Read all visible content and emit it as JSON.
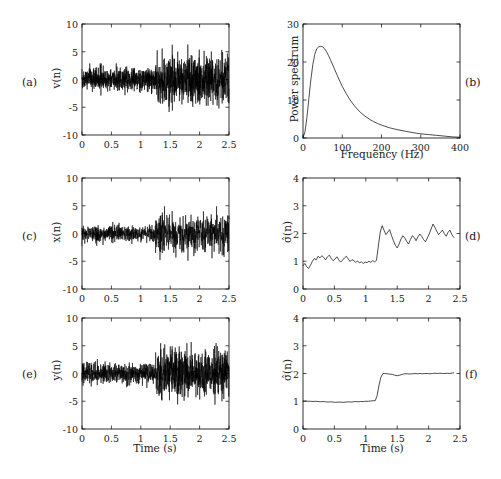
{
  "figure": {
    "width": 501,
    "height": 479,
    "background": "#ffffff",
    "line_color": "#000000"
  },
  "panel_labels": {
    "a": "(a)",
    "b": "(b)",
    "c": "(c)",
    "d": "(d)",
    "e": "(e)",
    "f": "(f)"
  },
  "chart_data": [
    {
      "id": "a",
      "type": "line",
      "title": "",
      "xlabel": "",
      "ylabel": "v(n)",
      "ylabel_glyph": "v(n)",
      "xlim": [
        0,
        2.5
      ],
      "ylim": [
        -10,
        10
      ],
      "xticks": [
        0,
        0.5,
        1,
        1.5,
        2,
        2.5
      ],
      "xticklabels": [
        "0",
        "0.5",
        "1",
        "1.5",
        "2",
        "2.5"
      ],
      "yticks": [
        -10,
        -5,
        0,
        5,
        10
      ],
      "yticklabels": [
        "-10",
        "-5",
        "0",
        "5",
        "10"
      ],
      "grid": false,
      "legend": "none",
      "description": "Noise signal v(n) with variance step change at t=1.25 s; amplitude envelope ~±2.8 before, ~±6.5 after",
      "signal": {
        "kind": "noise_burst",
        "seed": 11,
        "samples": 1400,
        "segments": [
          {
            "t_start": 0.0,
            "t_end": 1.25,
            "sigma": 1.0,
            "envelope": 2.9
          },
          {
            "t_start": 1.25,
            "t_end": 2.5,
            "sigma": 2.1,
            "envelope": 6.3
          }
        ]
      }
    },
    {
      "id": "b",
      "type": "line",
      "title": "",
      "xlabel": "Frequency (Hz)",
      "ylabel": "Power spectrum",
      "xlim": [
        0,
        400
      ],
      "ylim": [
        0,
        30
      ],
      "xticks": [
        0,
        100,
        200,
        300,
        400
      ],
      "xticklabels": [
        "0",
        "100",
        "200",
        "300",
        "400"
      ],
      "yticks": [
        0,
        10,
        20,
        30
      ],
      "yticklabels": [
        "0",
        "10",
        "20",
        "30"
      ],
      "grid": false,
      "legend": "none",
      "description": "Band-pass shaped power spectrum peaking at about 24 near 50 Hz, decaying toward 0 by 400 Hz",
      "peak": {
        "frequency": 50,
        "value": 24
      },
      "x": [
        0,
        5,
        10,
        15,
        20,
        25,
        30,
        35,
        40,
        45,
        50,
        55,
        60,
        65,
        70,
        80,
        90,
        100,
        110,
        120,
        130,
        140,
        150,
        160,
        170,
        180,
        190,
        200,
        220,
        240,
        260,
        280,
        300,
        320,
        340,
        360,
        380,
        400
      ],
      "y": [
        0.0,
        1.6,
        5.4,
        10.4,
        15.3,
        19.3,
        22.0,
        23.5,
        24.0,
        24.1,
        24.0,
        23.5,
        22.7,
        21.7,
        20.6,
        18.2,
        15.8,
        13.6,
        11.7,
        10.0,
        8.6,
        7.4,
        6.4,
        5.6,
        4.9,
        4.3,
        3.8,
        3.4,
        2.7,
        2.2,
        1.8,
        1.4,
        1.1,
        0.9,
        0.7,
        0.5,
        0.3,
        0.2
      ]
    },
    {
      "id": "c",
      "type": "line",
      "title": "",
      "xlabel": "",
      "ylabel": "x(n)",
      "ylabel_glyph": "x(n)",
      "xlim": [
        0,
        2.5
      ],
      "ylim": [
        -10,
        10
      ],
      "xticks": [
        0,
        0.5,
        1,
        1.5,
        2,
        2.5
      ],
      "xticklabels": [
        "0",
        "0.5",
        "1",
        "1.5",
        "2",
        "2.5"
      ],
      "yticks": [
        -10,
        -5,
        0,
        5,
        10
      ],
      "yticklabels": [
        "-10",
        "-5",
        "0",
        "5",
        "10"
      ],
      "grid": false,
      "legend": "none",
      "description": "Filtered signal x(n) with variance step change at t=1.25 s; envelope ~±2.2 before, ~±5.2 after",
      "signal": {
        "kind": "noise_burst",
        "seed": 27,
        "samples": 1100,
        "segments": [
          {
            "t_start": 0.0,
            "t_end": 1.25,
            "sigma": 1.0,
            "envelope": 2.2
          },
          {
            "t_start": 1.25,
            "t_end": 2.5,
            "sigma": 2.0,
            "envelope": 4.9
          }
        ]
      }
    },
    {
      "id": "d",
      "type": "line",
      "title": "",
      "xlabel": "",
      "ylabel": "σ̂(n)",
      "ylabel_glyph": "sigma-hat(n)",
      "xlim": [
        0,
        2.5
      ],
      "ylim": [
        0,
        4
      ],
      "xticks": [
        0,
        0.5,
        1,
        1.5,
        2,
        2.5
      ],
      "xticklabels": [
        "0",
        "0.5",
        "1",
        "1.5",
        "2",
        "2.5"
      ],
      "yticks": [
        0,
        1,
        2,
        3,
        4
      ],
      "yticklabels": [
        "0",
        "1",
        "2",
        "3",
        "4"
      ],
      "grid": false,
      "legend": "none",
      "description": "Noisy standard-deviation estimate stepping from about 1.0 to about 2.0 at t=1.18 s; trace ends near t=2.4 s",
      "step": {
        "time": 1.18,
        "before": 1.0,
        "after": 2.0
      },
      "x": [
        0.0,
        0.03,
        0.06,
        0.09,
        0.12,
        0.15,
        0.18,
        0.21,
        0.24,
        0.27,
        0.3,
        0.33,
        0.36,
        0.39,
        0.42,
        0.45,
        0.48,
        0.51,
        0.54,
        0.57,
        0.6,
        0.63,
        0.66,
        0.69,
        0.72,
        0.75,
        0.78,
        0.81,
        0.84,
        0.87,
        0.9,
        0.93,
        0.96,
        0.99,
        1.02,
        1.05,
        1.08,
        1.11,
        1.14,
        1.17,
        1.2,
        1.23,
        1.26,
        1.29,
        1.32,
        1.35,
        1.38,
        1.41,
        1.44,
        1.47,
        1.5,
        1.53,
        1.56,
        1.59,
        1.62,
        1.65,
        1.68,
        1.71,
        1.74,
        1.77,
        1.8,
        1.83,
        1.86,
        1.89,
        1.92,
        1.95,
        1.98,
        2.01,
        2.04,
        2.07,
        2.1,
        2.13,
        2.16,
        2.19,
        2.22,
        2.25,
        2.28,
        2.31,
        2.34,
        2.37,
        2.4
      ],
      "y": [
        0.84,
        0.92,
        0.8,
        0.74,
        0.86,
        1.0,
        1.1,
        1.05,
        1.18,
        1.12,
        1.2,
        1.14,
        1.05,
        1.16,
        1.22,
        1.1,
        1.02,
        1.08,
        1.16,
        1.05,
        0.97,
        1.04,
        1.12,
        1.18,
        1.08,
        0.99,
        1.06,
        1.02,
        0.96,
        1.01,
        0.94,
        0.98,
        0.92,
        0.97,
        0.95,
        1.0,
        0.96,
        1.02,
        0.98,
        1.03,
        1.55,
        2.05,
        2.28,
        2.12,
        1.96,
        2.05,
        2.14,
        1.92,
        1.74,
        1.58,
        1.48,
        1.62,
        1.8,
        1.92,
        1.84,
        1.72,
        1.62,
        1.78,
        1.92,
        1.86,
        1.74,
        1.88,
        1.98,
        1.9,
        1.78,
        1.7,
        1.84,
        1.98,
        2.16,
        2.34,
        2.22,
        2.08,
        1.96,
        2.04,
        2.12,
        2.0,
        1.9,
        2.04,
        2.12,
        1.96,
        1.86
      ]
    },
    {
      "id": "e",
      "type": "line",
      "title": "",
      "xlabel": "Time (s)",
      "ylabel": "y(n)",
      "ylabel_glyph": "y(n)",
      "xlim": [
        0,
        2.5
      ],
      "ylim": [
        -10,
        10
      ],
      "xticks": [
        0,
        0.5,
        1,
        1.5,
        2,
        2.5
      ],
      "xticklabels": [
        "0",
        "0.5",
        "1",
        "1.5",
        "2",
        "2.5"
      ],
      "yticks": [
        -10,
        -5,
        0,
        5,
        10
      ],
      "yticklabels": [
        "-10",
        "-5",
        "0",
        "5",
        "10"
      ],
      "grid": false,
      "legend": "none",
      "description": "Output signal y(n) with variance step change at t=1.25 s; envelope ~±2.6 before, ~±6.0 after",
      "signal": {
        "kind": "noise_burst",
        "seed": 43,
        "samples": 1300,
        "segments": [
          {
            "t_start": 0.0,
            "t_end": 1.25,
            "sigma": 1.0,
            "envelope": 2.6
          },
          {
            "t_start": 1.25,
            "t_end": 2.5,
            "sigma": 2.2,
            "envelope": 6.0
          }
        ]
      }
    },
    {
      "id": "f",
      "type": "line",
      "title": "",
      "xlabel": "Time (s)",
      "ylabel": "σ̂(n)",
      "ylabel_glyph": "sigma-hat(n)",
      "xlim": [
        0,
        2.5
      ],
      "ylim": [
        0,
        4
      ],
      "xticks": [
        0,
        0.5,
        1,
        1.5,
        2,
        2.5
      ],
      "xticklabels": [
        "0",
        "0.5",
        "1",
        "1.5",
        "2",
        "2.5"
      ],
      "yticks": [
        0,
        1,
        2,
        3,
        4
      ],
      "yticklabels": [
        "0",
        "1",
        "2",
        "3",
        "4"
      ],
      "grid": false,
      "legend": "none",
      "description": "Smoothed standard-deviation estimate stepping sharply from 1.0 to 2.0 between t=1.15 s and t=1.27 s; trace ends near t=2.4 s",
      "step": {
        "time": 1.2,
        "before": 1.0,
        "after": 2.0
      },
      "x": [
        0.0,
        0.04,
        0.08,
        0.12,
        0.16,
        0.2,
        0.24,
        0.28,
        0.32,
        0.36,
        0.4,
        0.44,
        0.48,
        0.52,
        0.56,
        0.6,
        0.64,
        0.68,
        0.72,
        0.76,
        0.8,
        0.84,
        0.88,
        0.92,
        0.96,
        1.0,
        1.04,
        1.08,
        1.12,
        1.15,
        1.18,
        1.21,
        1.24,
        1.27,
        1.3,
        1.34,
        1.38,
        1.42,
        1.46,
        1.5,
        1.54,
        1.58,
        1.62,
        1.66,
        1.7,
        1.74,
        1.78,
        1.82,
        1.86,
        1.9,
        1.94,
        1.98,
        2.02,
        2.06,
        2.1,
        2.14,
        2.18,
        2.22,
        2.26,
        2.3,
        2.34,
        2.38,
        2.4
      ],
      "y": [
        1.0,
        1.01,
        1.0,
        1.0,
        0.99,
        1.0,
        0.99,
        0.98,
        0.99,
        0.98,
        0.97,
        0.98,
        0.97,
        0.96,
        0.97,
        0.97,
        0.96,
        0.97,
        0.98,
        0.97,
        0.98,
        0.99,
        0.98,
        0.99,
        0.99,
        1.0,
        1.0,
        1.01,
        1.02,
        1.02,
        1.2,
        1.58,
        1.86,
        1.99,
        2.0,
        1.99,
        1.98,
        1.97,
        1.94,
        1.92,
        1.94,
        1.97,
        1.99,
        1.99,
        1.98,
        1.99,
        2.0,
        1.99,
        2.0,
        1.99,
        2.0,
        2.0,
        1.99,
        2.0,
        2.01,
        2.0,
        2.01,
        2.0,
        2.0,
        2.01,
        2.0,
        2.02,
        2.02
      ]
    }
  ]
}
